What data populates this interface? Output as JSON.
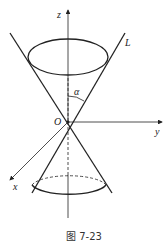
{
  "diagram": {
    "labels": {
      "z_axis": "z",
      "y_axis": "y",
      "x_axis": "x",
      "origin": "O",
      "line": "L",
      "angle": "α"
    },
    "caption": "图 7-23",
    "colors": {
      "stroke": "#222222",
      "background": "#ffffff"
    }
  }
}
